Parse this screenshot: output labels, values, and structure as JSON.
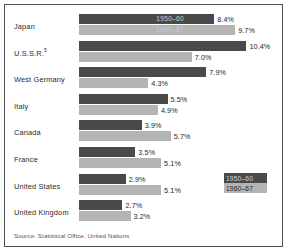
{
  "chart_data": {
    "type": "bar",
    "title": "",
    "orientation": "horizontal",
    "xlabel": "",
    "ylabel": "",
    "xlim": [
      0,
      11
    ],
    "grid": false,
    "legend_position": "right-lower",
    "categories": [
      "Japan",
      "U.S.S.R.",
      "West Germany",
      "Italy",
      "Canada",
      "France",
      "United States",
      "United Kingdom"
    ],
    "series": [
      {
        "name": "1950–60",
        "color": "#4a4a4a",
        "values": [
          8.4,
          10.4,
          7.9,
          5.5,
          3.9,
          3.5,
          2.9,
          2.7
        ],
        "value_labels": [
          "8.4%",
          "10.4%",
          "7.9%",
          "5.5%",
          "3.9%",
          "3.5%",
          "2.9%",
          "2.7%"
        ]
      },
      {
        "name": "1960–67",
        "color": "#b4b4b4",
        "values": [
          9.7,
          7.0,
          4.3,
          4.9,
          5.7,
          5.1,
          5.1,
          3.2
        ],
        "value_labels": [
          "9.7%",
          "7.0%",
          "4.3%",
          "4.9%",
          "5.7%",
          "5.1%",
          "5.1%",
          "3.2%"
        ]
      }
    ],
    "annotations": [
      "1950–60",
      "1960–67"
    ],
    "source": "Source: Statistical Office, United Nations"
  },
  "rows": [
    {
      "label": "Japan",
      "footnote": "",
      "v1": 8.4,
      "v2": 9.7,
      "l1": "8.4%",
      "l2": "9.7%"
    },
    {
      "label": "U.S.S.R.",
      "footnote": "5",
      "v1": 10.4,
      "v2": 7.0,
      "l1": "10.4%",
      "l2": "7.0%"
    },
    {
      "label": "West Germany",
      "footnote": "",
      "v1": 7.9,
      "v2": 4.3,
      "l1": "7.9%",
      "l2": "4.3%"
    },
    {
      "label": "Italy",
      "footnote": "",
      "v1": 5.5,
      "v2": 4.9,
      "l1": "5.5%",
      "l2": "4.9%"
    },
    {
      "label": "Canada",
      "footnote": "",
      "v1": 3.9,
      "v2": 5.7,
      "l1": "3.9%",
      "l2": "5.7%"
    },
    {
      "label": "France",
      "footnote": "",
      "v1": 3.5,
      "v2": 5.1,
      "l1": "3.5%",
      "l2": "5.1%"
    },
    {
      "label": "United States",
      "footnote": "",
      "v1": 2.9,
      "v2": 5.1,
      "l1": "2.9%",
      "l2": "5.1%"
    },
    {
      "label": "United Kingdom",
      "footnote": "",
      "v1": 2.7,
      "v2": 3.2,
      "l1": "2.7%",
      "l2": "3.2%"
    }
  ],
  "inbar": {
    "first": "1950–60",
    "second": "1960–67"
  },
  "legend": {
    "dark_label": "1950–60",
    "light_label": "1960–67"
  },
  "footer": {
    "source": "Source: Statistical Office, United Nations"
  },
  "scale": {
    "px_per_unit": 16.1,
    "bar_origin_px": 74
  }
}
